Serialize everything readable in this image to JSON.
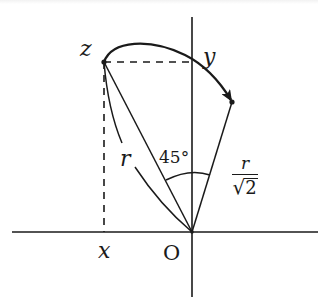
{
  "diagram": {
    "type": "geometric-rotation-diagram",
    "colors": {
      "stroke": "#1a1a1a",
      "background": "#ffffff"
    },
    "axes": {
      "origin_label": "O",
      "horizontal": {
        "from": [
          12,
          232
        ],
        "to": [
          318,
          232
        ]
      },
      "vertical": {
        "from": [
          192,
          17
        ],
        "to": [
          192,
          297
        ]
      }
    },
    "points": {
      "z": {
        "label": "z",
        "pos": [
          104,
          62
        ]
      },
      "end": {
        "pos": [
          232,
          102
        ]
      },
      "origin": {
        "pos": [
          192,
          232
        ]
      }
    },
    "labels": {
      "z": "z",
      "y": "y",
      "x": "x",
      "origin": "O",
      "r": "r",
      "angle": "45°",
      "fraction_numerator": "r",
      "fraction_denominator_symbol": "√",
      "fraction_denominator_value": "2"
    },
    "elements": [
      {
        "kind": "segment",
        "name": "Oz",
        "description": "line from origin to z, length r"
      },
      {
        "kind": "segment",
        "name": "O-end",
        "description": "line from origin to rotated point, length r/√2"
      },
      {
        "kind": "arc",
        "name": "radius-arc",
        "description": "arc of radius r through z, labeled r"
      },
      {
        "kind": "arc",
        "name": "angle-arc",
        "description": "angle of 45° between Oz and O-end"
      },
      {
        "kind": "dashed",
        "name": "z-to-x",
        "description": "vertical projection of z onto x axis"
      },
      {
        "kind": "dashed",
        "name": "z-to-y",
        "description": "horizontal projection of z onto y axis"
      },
      {
        "kind": "curved-arrow",
        "name": "rotation-arrow",
        "description": "curved arrow from z to rotated point"
      }
    ]
  }
}
